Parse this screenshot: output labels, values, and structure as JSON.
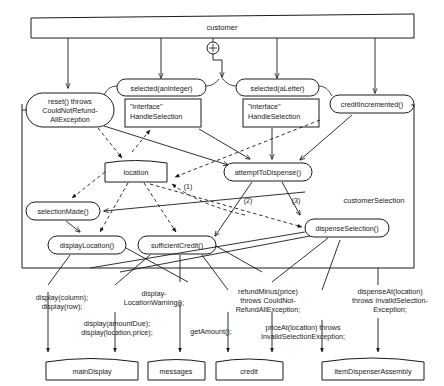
{
  "diagram": {
    "title": "customer",
    "group_label": "customerSelection",
    "plus_symbol": "+",
    "nodes": {
      "customer": "customer",
      "reset": [
        "reset() throws",
        "CouldNotRefund-",
        "AllException"
      ],
      "selected_integer": "selected(anInteger)",
      "selected_letter": "selected(aLetter)",
      "credit_incremented": "creditIncremented()",
      "interface_left": [
        "\"interface\"",
        "HandleSelection"
      ],
      "interface_right": [
        "\"interface\"",
        "HandleSelection"
      ],
      "location": "location",
      "attempt_to_dispense": "attemptToDispense()",
      "selection_made": "selectionMade()",
      "display_location": "displayLocation()",
      "sufficient_credit": "sufficientCredit()",
      "dispense_selection": "dispenseSelection()",
      "main_display": "mainDisplay",
      "messages": "messages",
      "credit": "credit",
      "item_dispenser_assembly": "itemDispenserAssembly"
    },
    "edge_labels": {
      "one": "(1)",
      "two": "(2)",
      "three": "(3)"
    },
    "bottom_labels": {
      "display_column_row": [
        "display(column);",
        "display(row);"
      ],
      "display_amount_due": [
        "display(amountDue);",
        "display(location,price);"
      ],
      "display_location_warning": [
        "display-",
        "LocationWarning();"
      ],
      "get_amount": [
        "getAmount();"
      ],
      "refund_minus": [
        "refundMinus(price)",
        "throws CouldNot-",
        "RefundAllException;"
      ],
      "price_at": [
        "priceAt(location) throws",
        "InvalidSelectionException;"
      ],
      "dispense_at": [
        "dispenseAt(location)",
        "throws InvalidSelection-",
        "Exception;"
      ]
    },
    "colors": {
      "line": "#1a1a1a",
      "fill": "#ffffff",
      "background": "#ffffff"
    }
  }
}
